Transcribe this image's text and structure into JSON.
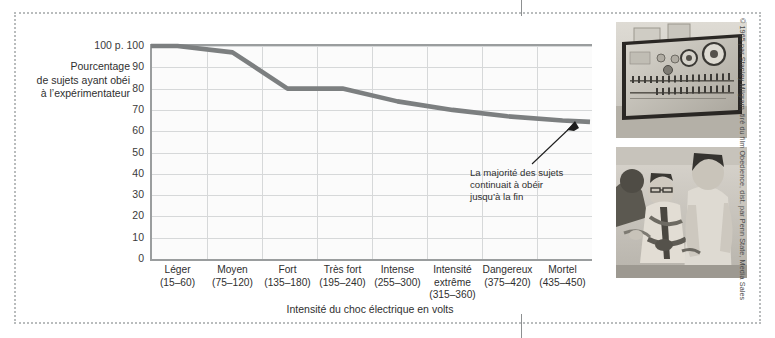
{
  "chart_data": {
    "type": "line",
    "title": "",
    "xlabel": "Intensité du choc électrique en volts",
    "ylabel": "Pourcentage de sujets ayant obéi à l’expérimentateur",
    "categories": [
      "Léger",
      "Moyen",
      "Fort",
      "Très fort",
      "Intense",
      "Intensité extrême",
      "Dangereux",
      "Mortel"
    ],
    "category_ranges": [
      "(15–60)",
      "(75–120)",
      "(135–180)",
      "(195–240)",
      "(255–300)",
      "(315–360)",
      "(375–420)",
      "(435–450)"
    ],
    "values": [
      100,
      97,
      80,
      80,
      74,
      70,
      67,
      65
    ],
    "ylim": [
      0,
      100
    ],
    "yticks": [
      "0",
      "10",
      "20",
      "30",
      "40",
      "50",
      "60",
      "70",
      "80",
      "90",
      "100"
    ],
    "ytop_label": "100 p. 100",
    "grid": true,
    "legend": "none",
    "series_color": "#7c7f80",
    "annotations": [
      {
        "text": "La majorité des sujets continuait à obéir jusqu’à la fin",
        "lines": [
          "La majorité des sujets",
          "continuait à obéir",
          "jusqu’à la fin"
        ]
      }
    ]
  },
  "axis": {
    "y_label_lines": [
      "Pourcentage",
      "de sujets ayant obéi",
      "à l’expérimentateur"
    ],
    "y_top_value": "100 p. 100",
    "x_title": "Intensité du choc électrique en volts"
  },
  "photos": [
    {
      "name": "shock-generator-photo",
      "caption": ""
    },
    {
      "name": "learner-strapped-photo",
      "caption": ""
    }
  ],
  "credit": "© 1965 par Stanley Milgram, tiré du film Obedience, dist. par Penn State, Media Sales",
  "colors": {
    "line": "#7c7f80",
    "axis": "#9a9d9e",
    "grid": "#d6d8d9",
    "frame": "#b9bcbd",
    "text": "#2f2f2f",
    "plot_bg": "#fbfbfb"
  }
}
